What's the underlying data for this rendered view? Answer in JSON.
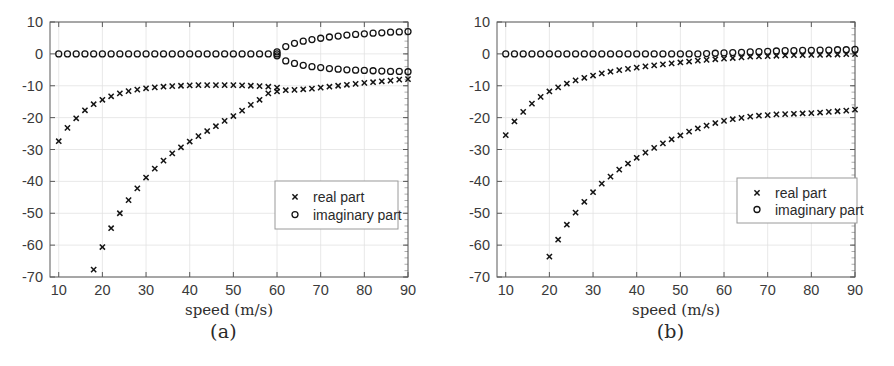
{
  "figure": {
    "panels": [
      {
        "caption": "(a)",
        "id": "panel-a"
      },
      {
        "caption": "(b)",
        "id": "panel-b"
      }
    ]
  },
  "chart_data": [
    {
      "type": "scatter",
      "panel": "(a)",
      "title": "",
      "xlabel": "speed (m/s)",
      "ylabel": "",
      "xlim": [
        8,
        90
      ],
      "ylim": [
        -70,
        10
      ],
      "xticks": [
        10,
        20,
        30,
        40,
        50,
        60,
        70,
        80,
        90
      ],
      "yticks": [
        10,
        0,
        -10,
        -20,
        -30,
        -40,
        -50,
        -60,
        -70
      ],
      "grid": true,
      "legend_position": "center-right",
      "legend": [
        "real part",
        "imaginary part"
      ],
      "series": [
        {
          "name": "real part",
          "branch": "upper",
          "marker": "x",
          "x": [
            10,
            12,
            14,
            16,
            18,
            20,
            22,
            24,
            26,
            28,
            30,
            32,
            34,
            36,
            38,
            40,
            42,
            44,
            46,
            48,
            50,
            52,
            54,
            56,
            58,
            60,
            62,
            64,
            66,
            68,
            70,
            72,
            74,
            76,
            78,
            80,
            82,
            84,
            86,
            88,
            90
          ],
          "y": [
            -27.4,
            -23.2,
            -20.2,
            -17.7,
            -15.8,
            -14.4,
            -13.3,
            -12.4,
            -11.7,
            -11.2,
            -10.8,
            -10.5,
            -10.3,
            -10.1,
            -10.0,
            -9.9,
            -9.8,
            -9.8,
            -9.8,
            -9.8,
            -9.8,
            -9.9,
            -10.0,
            -10.1,
            -10.3,
            -10.6,
            -11.4,
            -11.3,
            -11.1,
            -10.9,
            -10.6,
            -10.3,
            -10.0,
            -9.7,
            -9.4,
            -9.1,
            -8.9,
            -8.6,
            -8.4,
            -8.1,
            -7.9
          ]
        },
        {
          "name": "real part",
          "branch": "lower",
          "marker": "x",
          "x": [
            18,
            20,
            22,
            24,
            26,
            28,
            30,
            32,
            34,
            36,
            38,
            40,
            42,
            44,
            46,
            48,
            50,
            52,
            54,
            56,
            58,
            60
          ],
          "y": [
            -67.7,
            -60.6,
            -54.7,
            -50.0,
            -45.9,
            -42.2,
            -38.8,
            -36.0,
            -33.5,
            -31.2,
            -29.3,
            -27.5,
            -25.8,
            -24.2,
            -22.7,
            -21.0,
            -19.5,
            -17.8,
            -16.0,
            -14.4,
            -12.4,
            -11.8
          ]
        },
        {
          "name": "imaginary part",
          "branch": "zero",
          "marker": "o",
          "x": [
            10,
            12,
            14,
            16,
            18,
            20,
            22,
            24,
            26,
            28,
            30,
            32,
            34,
            36,
            38,
            40,
            42,
            44,
            46,
            48,
            50,
            52,
            54,
            56,
            58,
            60
          ],
          "y": [
            0,
            0,
            0,
            0,
            0,
            0,
            0,
            0,
            0,
            0,
            0,
            0,
            0,
            0,
            0,
            0,
            0,
            0,
            0,
            0,
            0,
            0,
            0,
            0,
            0,
            0
          ]
        },
        {
          "name": "imaginary part",
          "branch": "upper",
          "marker": "o",
          "x": [
            60,
            62,
            64,
            66,
            68,
            70,
            72,
            74,
            76,
            78,
            80,
            82,
            84,
            86,
            88,
            90
          ],
          "y": [
            0.6,
            2.3,
            3.3,
            4.0,
            4.5,
            4.9,
            5.3,
            5.6,
            5.9,
            6.1,
            6.3,
            6.5,
            6.6,
            6.8,
            6.9,
            7.0
          ]
        },
        {
          "name": "imaginary part",
          "branch": "lower",
          "marker": "o",
          "x": [
            60,
            62,
            64,
            66,
            68,
            70,
            72,
            74,
            76,
            78,
            80,
            82,
            84,
            86,
            88,
            90
          ],
          "y": [
            -0.6,
            -2.2,
            -3.0,
            -3.6,
            -4.0,
            -4.3,
            -4.6,
            -4.8,
            -5.0,
            -5.1,
            -5.2,
            -5.3,
            -5.4,
            -5.5,
            -5.5,
            -5.6
          ]
        }
      ]
    },
    {
      "type": "scatter",
      "panel": "(b)",
      "title": "",
      "xlabel": "speed (m/s)",
      "ylabel": "",
      "xlim": [
        8,
        90
      ],
      "ylim": [
        -70,
        10
      ],
      "xticks": [
        10,
        20,
        30,
        40,
        50,
        60,
        70,
        80,
        90
      ],
      "yticks": [
        10,
        0,
        -10,
        -20,
        -30,
        -40,
        -50,
        -60,
        -70
      ],
      "grid": true,
      "legend_position": "center-right",
      "legend": [
        "real part",
        "imaginary part"
      ],
      "series": [
        {
          "name": "real part",
          "branch": "upper",
          "marker": "x",
          "x": [
            10,
            12,
            14,
            16,
            18,
            20,
            22,
            24,
            26,
            28,
            30,
            32,
            34,
            36,
            38,
            40,
            42,
            44,
            46,
            48,
            50,
            52,
            54,
            56,
            58,
            60,
            62,
            64,
            66,
            68,
            70,
            72,
            74,
            76,
            78,
            80,
            82,
            84,
            86,
            88,
            90
          ],
          "y": [
            -25.5,
            -21.2,
            -18.2,
            -15.6,
            -13.5,
            -11.8,
            -10.5,
            -9.3,
            -8.3,
            -7.5,
            -6.8,
            -6.1,
            -5.6,
            -5.1,
            -4.7,
            -4.3,
            -3.9,
            -3.6,
            -3.3,
            -3.0,
            -2.7,
            -2.4,
            -2.1,
            -1.9,
            -1.7,
            -1.5,
            -1.3,
            -1.1,
            -0.9,
            -0.8,
            -0.7,
            -0.6,
            -0.5,
            -0.4,
            -0.4,
            -0.3,
            -0.3,
            -0.2,
            -0.2,
            -0.1,
            -0.1
          ]
        },
        {
          "name": "real part",
          "branch": "lower",
          "marker": "x",
          "x": [
            20,
            22,
            24,
            26,
            28,
            30,
            32,
            34,
            36,
            38,
            40,
            42,
            44,
            46,
            48,
            50,
            52,
            54,
            56,
            58,
            60,
            62,
            64,
            66,
            68,
            70,
            72,
            74,
            76,
            78,
            80,
            82,
            84,
            86,
            88,
            90
          ],
          "y": [
            -63.6,
            -58.3,
            -53.6,
            -49.8,
            -46.4,
            -43.4,
            -40.7,
            -38.5,
            -36.3,
            -34.4,
            -32.6,
            -31.0,
            -29.5,
            -28.1,
            -26.8,
            -25.6,
            -24.4,
            -23.4,
            -22.5,
            -21.7,
            -21.0,
            -20.5,
            -20.1,
            -19.7,
            -19.4,
            -19.2,
            -19.0,
            -18.9,
            -18.8,
            -18.7,
            -18.6,
            -18.4,
            -18.2,
            -18.0,
            -17.8,
            -17.5
          ]
        },
        {
          "name": "imaginary part",
          "branch": "zero",
          "marker": "o",
          "x": [
            10,
            12,
            14,
            16,
            18,
            20,
            22,
            24,
            26,
            28,
            30,
            32,
            34,
            36,
            38,
            40,
            42,
            44,
            46,
            48,
            50,
            52,
            54,
            56,
            58,
            60,
            62,
            64,
            66,
            68,
            70,
            72,
            74,
            76,
            78,
            80,
            82,
            84,
            86,
            88,
            90
          ],
          "y": [
            0,
            0,
            0,
            0,
            0,
            0,
            0,
            0,
            0,
            0,
            0,
            0,
            0,
            0,
            0,
            0,
            0,
            0,
            0,
            0,
            0,
            0,
            0,
            0.1,
            0.2,
            0.3,
            0.4,
            0.5,
            0.6,
            0.7,
            0.8,
            0.9,
            1.0,
            1.0,
            1.1,
            1.1,
            1.2,
            1.2,
            1.3,
            1.3,
            1.4
          ]
        }
      ]
    }
  ]
}
